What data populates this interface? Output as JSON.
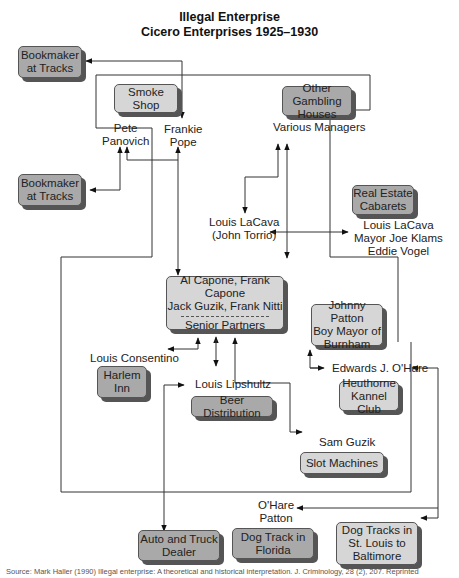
{
  "title": {
    "line1": "Illegal Enterprise",
    "line2": "Cicero Enterprises 1925–1930"
  },
  "boxes": {
    "bookmaker_top": {
      "line1": "Bookmaker",
      "line2": "at Tracks"
    },
    "smoke_shop": {
      "line1": "Smoke Shop"
    },
    "other_gambling": {
      "line1": "Other Gambling",
      "line2": "Houses"
    },
    "bookmaker_mid": {
      "line1": "Bookmaker",
      "line2": "at Tracks"
    },
    "real_estate": {
      "line1": "Real Estate",
      "line2": "Cabarets"
    },
    "senior_partners": {
      "line1": "Al Capone, Frank Capone",
      "line2": "Jack Guzik, Frank Nitti",
      "line3": "Senior Partners"
    },
    "johnny_patton": {
      "line1": "Johnny Patton",
      "line2": "Boy Mayor of",
      "line3": "Burnham"
    },
    "harlem_inn": {
      "line1": "Harlem",
      "line2": "Inn"
    },
    "beer_distribution": {
      "line1": "Beer Distribution"
    },
    "heuthorne": {
      "line1": "Heuthorne",
      "line2": "Kannel Club"
    },
    "slot_machines": {
      "line1": "Slot Machines"
    },
    "auto_truck": {
      "line1": "Auto and Truck",
      "line2": "Dealer"
    },
    "dog_florida": {
      "line1": "Dog Track in",
      "line2": "Florida"
    },
    "dog_stlouis": {
      "line1": "Dog Tracks in",
      "line2": "St. Louis to",
      "line3": "Baltimore"
    }
  },
  "labels": {
    "pete": {
      "line1": "Pete",
      "line2": "Panovich"
    },
    "frankie": {
      "line1": "Frankie",
      "line2": "Pope"
    },
    "various_managers": "Various Managers",
    "lacava_torrio": {
      "line1": "Louis LaCava",
      "line2": "(John Torrio)"
    },
    "lacava_group": {
      "line1": "Louis LaCava",
      "line2": "Mayor Joe Klams",
      "line3": "Eddie Vogel"
    },
    "consentino": "Louis Consentino",
    "lipshultz": "Louis Lipshultz",
    "ohare_edwards": "Edwards J. O'Hare",
    "sam_guzik": "Sam Guzik",
    "ohare_patton": {
      "line1": "O'Hare",
      "line2": "Patton"
    }
  },
  "source": "Source: Mark Haller (1990) Illegal enterprise: A theoretical and historical interpretation. J. Criminology, 28 (2), 207. Reprinted"
}
